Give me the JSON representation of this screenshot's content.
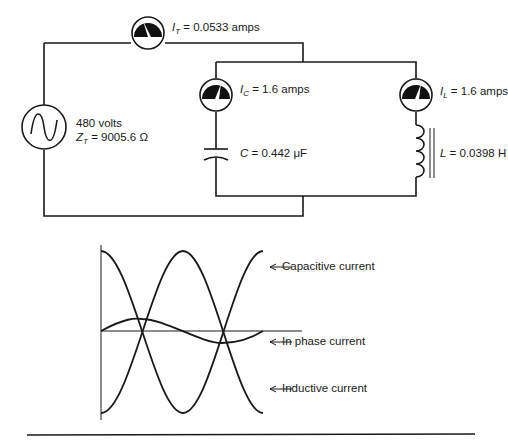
{
  "circuit": {
    "source": {
      "voltage": "480 volts",
      "impedance_symbol": "Z",
      "impedance_sub": "T",
      "impedance_value": "= 9005.6 Ω"
    },
    "total_meter": {
      "symbol": "I",
      "sub": "T",
      "value": "= 0.0533 amps"
    },
    "cap_meter": {
      "symbol": "I",
      "sub": "C",
      "value": "= 1.6 amps"
    },
    "ind_meter": {
      "symbol": "I",
      "sub": "L",
      "value": "= 1.6 amps"
    },
    "capacitor": {
      "symbol": "C",
      "value": "= 0.442 μF"
    },
    "inductor": {
      "symbol": "L",
      "value": "= 0.0398 H"
    }
  },
  "waveforms": {
    "capacitive": "Capacitive current",
    "in_phase": "In phase current",
    "inductive": "Inductive current"
  }
}
